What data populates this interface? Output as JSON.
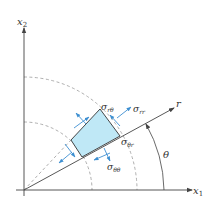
{
  "diagram": {
    "axes": {
      "x1_label": "x",
      "x1_sub": "1",
      "x2_label": "x",
      "x2_sub": "2",
      "r_label": "r",
      "theta_label": "θ"
    },
    "stresses": {
      "rtheta": {
        "sym": "σ",
        "sub": "rθ"
      },
      "rr": {
        "sym": "σ",
        "sub": "rr"
      },
      "thetar": {
        "sym": "σ",
        "sub": "θr"
      },
      "thetatheta": {
        "sym": "σ",
        "sub": "θθ"
      }
    },
    "colors": {
      "element_fill": "#bfe8f6",
      "arrow": "#3d8fd1",
      "axis": "#444444",
      "dashed": "#9a9a9a"
    }
  }
}
